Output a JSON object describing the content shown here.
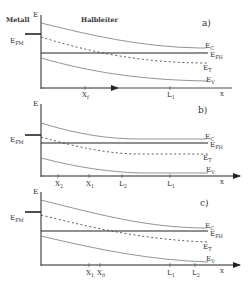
{
  "header": {
    "left": "Metall",
    "right": "Halbleiter"
  },
  "axis": {
    "y_label": "E",
    "x_label": "x"
  },
  "levels": {
    "fermi_metal": {
      "main": "E",
      "sub": "FM"
    },
    "conduction": {
      "main": "E",
      "sub": "C"
    },
    "fermi_semi": {
      "main": "E",
      "sub": "FH"
    },
    "trap": {
      "main": "E",
      "sub": "T"
    },
    "valence": {
      "main": "E",
      "sub": "V"
    }
  },
  "panels": [
    {
      "label": "a)",
      "ticks": [
        {
          "main": "X",
          "sub": "f"
        },
        {
          "main": "L",
          "sub": "1"
        }
      ]
    },
    {
      "label": "b)",
      "ticks": [
        {
          "main": "X",
          "sub": "2"
        },
        {
          "main": "X",
          "sub": "1"
        },
        {
          "main": "L",
          "sub": "2"
        },
        {
          "main": "L",
          "sub": "1"
        }
      ]
    },
    {
      "label": "c)",
      "ticks": [
        {
          "main": "X",
          "sub": "1"
        },
        {
          "main": "X",
          "sub": "0"
        },
        {
          "main": "L",
          "sub": "1"
        },
        {
          "main": "L",
          "sub": "2"
        }
      ]
    }
  ]
}
